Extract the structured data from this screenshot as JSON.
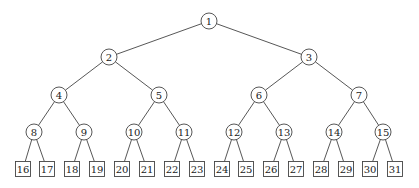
{
  "diagram": {
    "type": "binary-tree",
    "internal_nodes": [
      {
        "id": "1",
        "x": 209,
        "y": 21
      },
      {
        "id": "2",
        "x": 109,
        "y": 57
      },
      {
        "id": "3",
        "x": 309,
        "y": 57
      },
      {
        "id": "4",
        "x": 59,
        "y": 95
      },
      {
        "id": "5",
        "x": 159,
        "y": 95
      },
      {
        "id": "6",
        "x": 259,
        "y": 95
      },
      {
        "id": "7",
        "x": 359,
        "y": 95
      },
      {
        "id": "8",
        "x": 34,
        "y": 132
      },
      {
        "id": "9",
        "x": 84,
        "y": 132
      },
      {
        "id": "10",
        "x": 134,
        "y": 132
      },
      {
        "id": "11",
        "x": 184,
        "y": 132
      },
      {
        "id": "12",
        "x": 234,
        "y": 132
      },
      {
        "id": "13",
        "x": 284,
        "y": 132
      },
      {
        "id": "14",
        "x": 334,
        "y": 132
      },
      {
        "id": "15",
        "x": 383,
        "y": 132
      }
    ],
    "leaves": [
      {
        "id": "16",
        "x": 23,
        "y": 169
      },
      {
        "id": "17",
        "x": 47,
        "y": 169
      },
      {
        "id": "18",
        "x": 72,
        "y": 169
      },
      {
        "id": "19",
        "x": 97,
        "y": 169
      },
      {
        "id": "20",
        "x": 122,
        "y": 169
      },
      {
        "id": "21",
        "x": 147,
        "y": 169
      },
      {
        "id": "22",
        "x": 172,
        "y": 169
      },
      {
        "id": "23",
        "x": 197,
        "y": 169
      },
      {
        "id": "24",
        "x": 222,
        "y": 169
      },
      {
        "id": "25",
        "x": 246,
        "y": 169
      },
      {
        "id": "26",
        "x": 271,
        "y": 169
      },
      {
        "id": "27",
        "x": 296,
        "y": 169
      },
      {
        "id": "28",
        "x": 321,
        "y": 169
      },
      {
        "id": "29",
        "x": 346,
        "y": 169
      },
      {
        "id": "30",
        "x": 370,
        "y": 169
      },
      {
        "id": "31",
        "x": 395,
        "y": 169
      }
    ],
    "edges": [
      [
        "1",
        "2"
      ],
      [
        "1",
        "3"
      ],
      [
        "2",
        "4"
      ],
      [
        "2",
        "5"
      ],
      [
        "3",
        "6"
      ],
      [
        "3",
        "7"
      ],
      [
        "4",
        "8"
      ],
      [
        "4",
        "9"
      ],
      [
        "5",
        "10"
      ],
      [
        "5",
        "11"
      ],
      [
        "6",
        "12"
      ],
      [
        "6",
        "13"
      ],
      [
        "7",
        "14"
      ],
      [
        "7",
        "15"
      ],
      [
        "8",
        "16"
      ],
      [
        "8",
        "17"
      ],
      [
        "9",
        "18"
      ],
      [
        "9",
        "19"
      ],
      [
        "10",
        "20"
      ],
      [
        "10",
        "21"
      ],
      [
        "11",
        "22"
      ],
      [
        "11",
        "23"
      ],
      [
        "12",
        "24"
      ],
      [
        "12",
        "25"
      ],
      [
        "13",
        "26"
      ],
      [
        "13",
        "27"
      ],
      [
        "14",
        "28"
      ],
      [
        "14",
        "29"
      ],
      [
        "15",
        "30"
      ],
      [
        "15",
        "31"
      ]
    ],
    "style": {
      "stroke": "#444444",
      "fill": "#ffffff",
      "circle_radius": 8,
      "leaf_box_size": 15
    }
  }
}
